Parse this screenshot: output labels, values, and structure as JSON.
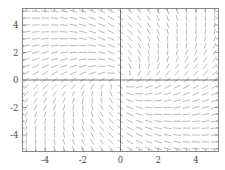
{
  "figure": {
    "kind": "slope-field",
    "background_color": "#ffffff",
    "frame_color": "#7a7a7a",
    "axis_color": "#555555",
    "segment_color": "#8a8a8a",
    "tick_color": "#7a7a7a",
    "label_color": "#4a4a4a"
  },
  "chart_data": {
    "type": "scatter",
    "title": "",
    "subtitle": "",
    "xlabel": "",
    "ylabel": "",
    "xlim": [
      -5.2,
      5.2
    ],
    "ylim": [
      -5.2,
      5.2
    ],
    "grid": false,
    "legend": [],
    "legend_position": "none",
    "annotations": [],
    "xticks": [
      -4,
      -2,
      0,
      2,
      4
    ],
    "xtick_labels": [
      "-4",
      "-2",
      "0",
      "2",
      "4"
    ],
    "yticks": [
      -4,
      -2,
      0,
      2,
      4
    ],
    "ytick_labels": [
      "-4",
      "-2",
      "0",
      "2",
      "4"
    ],
    "x_minor_tick_step": 0.5,
    "y_minor_tick_step": 0.5,
    "axes_through_origin": true,
    "field": {
      "description": "Direction field of a first-order ODE; short line segments drawn on a regular lattice with slope m(x,y).",
      "slope_formula": "(x + y) / (x - y)",
      "grid_x_start": -5.0,
      "grid_x_end": 5.0,
      "grid_x_count": 21,
      "grid_y_start": -5.0,
      "grid_y_end": 5.0,
      "grid_y_count": 21,
      "segment_length": 0.42,
      "segment_width": 0.6
    }
  }
}
